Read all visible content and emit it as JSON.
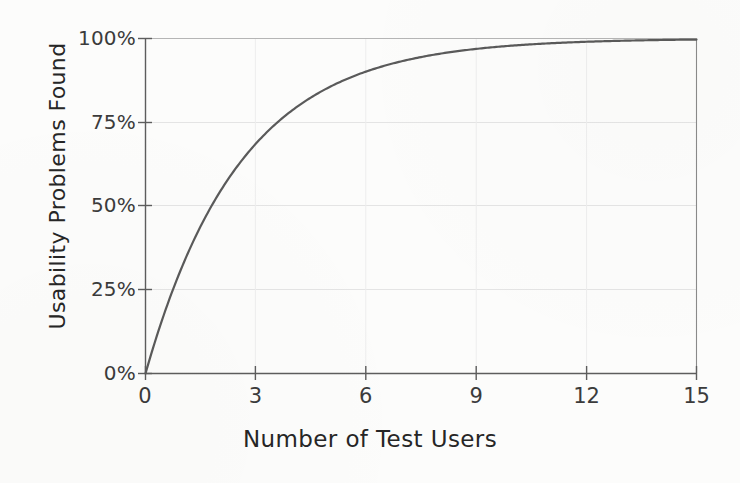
{
  "chart_data": {
    "type": "line",
    "title": "",
    "subtitle": "",
    "xlabel": "Number of Test Users",
    "ylabel": "Usability Problems Found",
    "xlim": [
      0,
      15
    ],
    "ylim": [
      0,
      100
    ],
    "xticks": [
      0,
      3,
      6,
      9,
      12,
      15
    ],
    "xtick_labels": [
      "0",
      "3",
      "6",
      "9",
      "12",
      "15"
    ],
    "yticks": [
      0,
      25,
      50,
      75,
      100
    ],
    "ytick_labels": [
      "0%",
      "25%",
      "50%",
      "75%",
      "100%"
    ],
    "grid": true,
    "legend": null,
    "annotations": [],
    "series": [
      {
        "name": "Usability problems found",
        "color": "#5a5a5a",
        "line_width": 2.2,
        "formula": "100 * (1 - (1 - 0.32)^n)",
        "x": [
          0,
          0.25,
          0.5,
          0.75,
          1,
          1.5,
          2,
          2.5,
          3,
          3.5,
          4,
          4.5,
          5,
          5.5,
          6,
          6.5,
          7,
          7.5,
          8,
          8.5,
          9,
          9.5,
          10,
          10.5,
          11,
          11.5,
          12,
          12.5,
          13,
          13.5,
          14,
          14.5,
          15
        ],
        "values": [
          0,
          9.3,
          17.6,
          25.1,
          32,
          43.8,
          53.8,
          62.2,
          69.3,
          75.3,
          79.4,
          83.2,
          86.5,
          88.6,
          90.8,
          92.4,
          93.7,
          94.8,
          95.7,
          96.4,
          97.1,
          97.6,
          98.0,
          98.4,
          98.7,
          98.9,
          99.1,
          99.3,
          99.4,
          99.5,
          99.6,
          99.7,
          99.8
        ]
      }
    ]
  },
  "chart": {
    "axis_color": "#6e6e6e",
    "grid_color": "#e2e2e2",
    "text_color": "#333333",
    "background": "#fcfcfb"
  }
}
